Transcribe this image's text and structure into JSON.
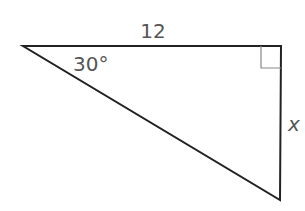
{
  "diagram": {
    "type": "right-triangle",
    "labels": {
      "top_side": "12",
      "angle": "30°",
      "right_side": "x"
    },
    "colors": {
      "stroke": "#222222",
      "right_angle_mark": "#888888",
      "label": "#555555"
    }
  }
}
